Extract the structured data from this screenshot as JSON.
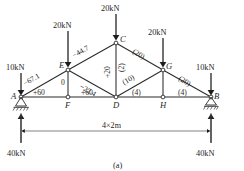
{
  "figure": {
    "caption": "(a)",
    "span_label": "4×2m"
  },
  "nodes": [
    {
      "id": "A",
      "label": "A"
    },
    {
      "id": "B",
      "label": "B"
    },
    {
      "id": "C",
      "label": "C"
    },
    {
      "id": "D",
      "label": "D"
    },
    {
      "id": "E",
      "label": "E"
    },
    {
      "id": "F",
      "label": "F"
    },
    {
      "id": "G",
      "label": "G"
    },
    {
      "id": "H",
      "label": "H"
    }
  ],
  "loads": [
    {
      "at": "A",
      "label": "10kN"
    },
    {
      "at": "E",
      "label": "20kN"
    },
    {
      "at": "C",
      "label": "20kN"
    },
    {
      "at": "G",
      "label": "20kN"
    },
    {
      "at": "B",
      "label": "10kN"
    }
  ],
  "reactions": [
    {
      "at": "A",
      "label": "40kN"
    },
    {
      "at": "B",
      "label": "40kN"
    }
  ],
  "member_forces": [
    {
      "member": "AE",
      "label": "−67.1"
    },
    {
      "member": "EC",
      "label": "−44.7"
    },
    {
      "member": "EF",
      "label": "0"
    },
    {
      "member": "ED",
      "label": "−22.4"
    },
    {
      "member": "AF",
      "label": "+60"
    },
    {
      "member": "FD",
      "label": "+60"
    },
    {
      "member": "CD-left",
      "label": "+20"
    },
    {
      "member": "CD-right",
      "label": "(2)"
    },
    {
      "member": "CG",
      "label": "(20)"
    },
    {
      "member": "DG",
      "label": "(10)"
    },
    {
      "member": "GB",
      "label": "(20)"
    },
    {
      "member": "DH",
      "label": "(4)"
    },
    {
      "member": "HB",
      "label": "(4)"
    }
  ],
  "supports": [
    {
      "at": "A",
      "type": "pin-support"
    },
    {
      "at": "B",
      "type": "roller-support"
    }
  ]
}
